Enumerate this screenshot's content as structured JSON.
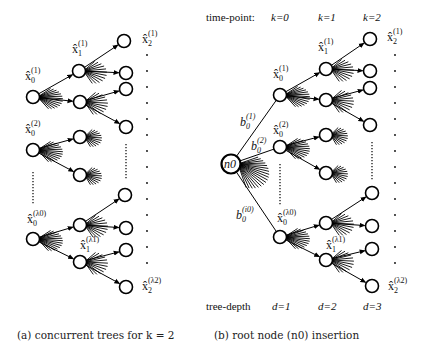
{
  "panel_a": {
    "caption": "(a) concurrent trees for k = 2",
    "labels": {
      "x0_1": {
        "base": "x̂",
        "sub": "0",
        "sup": "(1)"
      },
      "x1_1": {
        "base": "x̂",
        "sub": "1",
        "sup": "(1)"
      },
      "x2_1": {
        "base": "x̂",
        "sub": "2",
        "sup": "(1)"
      },
      "x0_2": {
        "base": "x̂",
        "sub": "0",
        "sup": "(2)"
      },
      "x0_l0": {
        "base": "x̂",
        "sub": "0",
        "sup": "(λ0)"
      },
      "x1_l1": {
        "base": "x̂",
        "sub": "1",
        "sup": "(λ1)"
      },
      "x2_l2": {
        "base": "x̂",
        "sub": "2",
        "sup": "(λ2)"
      }
    },
    "trees": [
      {
        "root": [
          33,
          97
        ],
        "children": [
          [
            79,
            71
          ],
          [
            80,
            102
          ]
        ],
        "leaves": [
          [
            124,
            41
          ],
          [
            126,
            73
          ],
          [
            126,
            89
          ],
          [
            126,
            127
          ]
        ]
      },
      {
        "root": [
          33,
          150
        ],
        "children": [
          [
            80,
            137
          ],
          [
            80,
            175
          ]
        ],
        "leaves": []
      },
      {
        "root": [
          33,
          239
        ],
        "children": [
          [
            80,
            225
          ],
          [
            80,
            262
          ]
        ],
        "leaves": [
          [
            125,
            195
          ],
          [
            126,
            228
          ],
          [
            126,
            250
          ],
          [
            126,
            287
          ]
        ]
      }
    ]
  },
  "panel_b": {
    "caption": "(b) root node (n0) insertion",
    "time_row": {
      "label": "time-point:",
      "ticks": [
        "k=0",
        "k=1",
        "k=2"
      ]
    },
    "depth_row": {
      "label": "tree-depth",
      "ticks": [
        "d=1",
        "d=2",
        "d=3"
      ]
    },
    "root_label": "n0",
    "branch_labels": {
      "b1": {
        "base": "b",
        "sub": "0",
        "sup": "(1)"
      },
      "b2": {
        "base": "b",
        "sub": "0",
        "sup": "(2)"
      },
      "bi": {
        "base": "b",
        "sub": "0",
        "sup": "(i0)"
      }
    },
    "labels": {
      "x0_1": {
        "base": "x̂",
        "sub": "0",
        "sup": "(1)"
      },
      "x1_1": {
        "base": "x̂",
        "sub": "1",
        "sup": "(1)"
      },
      "x2_1": {
        "base": "x̂",
        "sub": "2",
        "sup": "(1)"
      },
      "x0_2": {
        "base": "x̂",
        "sub": "0",
        "sup": "(2)"
      },
      "x0_l0": {
        "base": "x̂",
        "sub": "0",
        "sup": "(λ0)"
      },
      "x1_l1": {
        "base": "x̂",
        "sub": "1",
        "sup": "(λ1)"
      },
      "x2_l2": {
        "base": "x̂",
        "sub": "2",
        "sup": "(λ2)"
      }
    },
    "root": [
      231,
      164
    ],
    "trees": [
      {
        "root": [
          280,
          95
        ],
        "children": [
          [
            326,
            69
          ],
          [
            326,
            100
          ]
        ],
        "leaves": [
          [
            370,
            39
          ],
          [
            370,
            71
          ],
          [
            370,
            88
          ],
          [
            370,
            125
          ]
        ]
      },
      {
        "root": [
          280,
          147
        ],
        "children": [
          [
            326,
            135
          ],
          [
            326,
            173
          ]
        ],
        "leaves": []
      },
      {
        "root": [
          280,
          237
        ],
        "children": [
          [
            326,
            223
          ],
          [
            326,
            260
          ]
        ],
        "leaves": [
          [
            372,
            193
          ],
          [
            372,
            226
          ],
          [
            372,
            249
          ],
          [
            372,
            286
          ]
        ]
      }
    ]
  }
}
